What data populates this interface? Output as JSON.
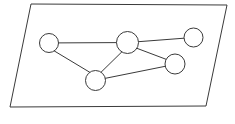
{
  "figure": {
    "background_color": "#ffffff",
    "stroke_color": "#3a3a3a",
    "node_fill_color": "#ffffff",
    "stroke_width": 1,
    "canvas": {
      "width": 235,
      "height": 124
    }
  },
  "plane": {
    "name": "plane-parallelogram",
    "points": "31,4 227,5 206,106 10,107",
    "corners": [
      {
        "label": "top-left",
        "x": 31,
        "y": 4
      },
      {
        "label": "top-right",
        "x": 227,
        "y": 5
      },
      {
        "label": "bottom-right",
        "x": 206,
        "y": 106
      },
      {
        "label": "bottom-left",
        "x": 10,
        "y": 107
      }
    ]
  },
  "graph": {
    "node_count": 5,
    "edge_count": 6,
    "nodes": [
      {
        "id": "n1",
        "name": "node-left",
        "cx": 49,
        "cy": 43,
        "r": 9.5
      },
      {
        "id": "n2",
        "name": "node-center",
        "cx": 127.5,
        "cy": 42.5,
        "r": 11
      },
      {
        "id": "n3",
        "name": "node-top-right",
        "cx": 193.5,
        "cy": 37.5,
        "r": 9.5
      },
      {
        "id": "n4",
        "name": "node-bottom-right",
        "cx": 175,
        "cy": 64,
        "r": 10
      },
      {
        "id": "n5",
        "name": "node-bottom-center",
        "cx": 95.5,
        "cy": 80.5,
        "r": 10
      }
    ],
    "edges": [
      {
        "id": "e1",
        "name": "edge-left-to-center",
        "from": "n1",
        "to": "n2",
        "x1": 58.5,
        "y1": 42.9,
        "x2": 116.5,
        "y2": 42.6
      },
      {
        "id": "e2",
        "name": "edge-left-to-bottom-center",
        "from": "n1",
        "to": "n5",
        "x1": 54.2,
        "y1": 50.9,
        "x2": 90.3,
        "y2": 72.6
      },
      {
        "id": "e3",
        "name": "edge-center-to-bottom-center",
        "from": "n2",
        "to": "n5",
        "x1": 121.8,
        "y1": 51.9,
        "x2": 101.2,
        "y2": 72.1
      },
      {
        "id": "e4",
        "name": "edge-center-to-top-right",
        "from": "n2",
        "to": "n3",
        "x1": 138.4,
        "y1": 41.7,
        "x2": 184.1,
        "y2": 38.2
      },
      {
        "id": "e5",
        "name": "edge-center-to-bottom-right",
        "from": "n2",
        "to": "n4",
        "x1": 136.9,
        "y1": 48.3,
        "x2": 166.1,
        "y2": 59.3
      },
      {
        "id": "e6",
        "name": "edge-bottom-center-to-bottom-right",
        "from": "n5",
        "to": "n4",
        "x1": 105.4,
        "y1": 78.3,
        "x2": 165.2,
        "y2": 66.3
      }
    ]
  }
}
